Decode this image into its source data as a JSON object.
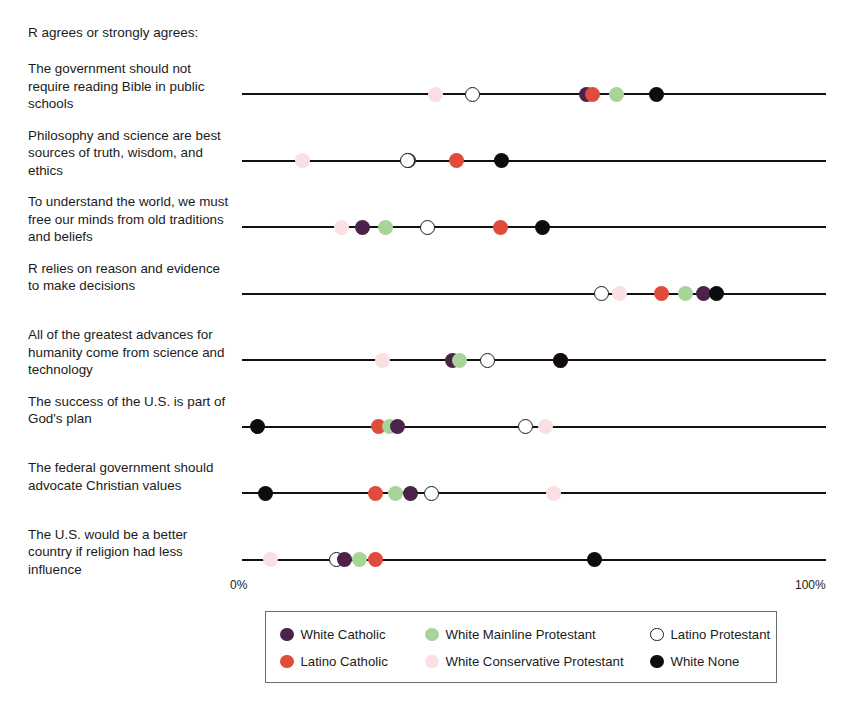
{
  "header": {
    "note": "R agrees or strongly agrees:"
  },
  "axis": {
    "min_label": "0%",
    "max_label": "100%",
    "min": 0,
    "max": 100
  },
  "legend": {
    "entries": [
      {
        "label": "White Catholic",
        "color": "#4b2348",
        "style": "filled"
      },
      {
        "label": "White Mainline Protestant",
        "color": "#a8d49a",
        "style": "filled"
      },
      {
        "label": "Latino Protestant",
        "color": "#ffffff",
        "style": "hollow"
      },
      {
        "label": "Latino Catholic",
        "color": "#e14b3c",
        "style": "filled"
      },
      {
        "label": "White Conservative Protestant",
        "color": "#fadfe3",
        "style": "filled"
      },
      {
        "label": "White None",
        "color": "#0d0d0d",
        "style": "filled"
      }
    ]
  },
  "chart_data": {
    "type": "scatter",
    "title": "R agrees or strongly agrees:",
    "xlabel": "",
    "ylabel": "",
    "xlim": [
      0,
      100
    ],
    "xticks": [
      0,
      100
    ],
    "xticklabels": [
      "0%",
      "100%"
    ],
    "grid": false,
    "legend_position": "bottom",
    "series": [
      {
        "name": "White Catholic",
        "color": "#4b2348",
        "style": "filled",
        "values": [
          59.0,
          28.5,
          20.7,
          79.0,
          36.0,
          26.7,
          28.8,
          17.6
        ]
      },
      {
        "name": "Latino Catholic",
        "color": "#e14b3c",
        "style": "filled",
        "values": [
          60.0,
          36.8,
          44.2,
          71.9,
          54.5,
          23.3,
          22.8,
          22.8
        ]
      },
      {
        "name": "White Mainline Protestant",
        "color": "#a8d49a",
        "style": "filled",
        "values": [
          64.2,
          null,
          24.5,
          75.9,
          37.3,
          25.3,
          26.2,
          20.2
        ]
      },
      {
        "name": "White Conservative Protestant",
        "color": "#fadfe3",
        "style": "filled",
        "values": [
          33.2,
          10.3,
          17.1,
          64.7,
          24.1,
          51.9,
          53.3,
          4.8
        ]
      },
      {
        "name": "Latino Protestant",
        "color": "#ffffff",
        "style": "hollow",
        "values": [
          39.4,
          28.4,
          31.7,
          61.5,
          42.1,
          48.5,
          32.5,
          16.1
        ]
      },
      {
        "name": "White None",
        "color": "#0d0d0d",
        "style": "filled",
        "values": [
          70.9,
          44.4,
          51.5,
          81.3,
          54.5,
          2.6,
          4.1,
          60.4
        ]
      }
    ],
    "categories": [
      "The government should not require reading Bible in public schools",
      "Philosophy and science are best sources of truth, wisdom, and ethics",
      "To understand the world, we must free our minds from old traditions and beliefs",
      "R relies on reason and evidence to make decisions",
      "All of the greatest advances for humanity come from science and technology",
      "The success of the U.S. is part of God's plan",
      "The federal government should advocate Christian values",
      "The U.S. would be a better country if religion had less influence"
    ]
  },
  "rows": [
    {
      "label": "The government should not require reading Bible in public schools",
      "points": [
        {
          "group": "White Conservative Protestant",
          "value": 33.2,
          "color": "#fadfe3",
          "style": "filled"
        },
        {
          "group": "Latino Protestant",
          "value": 39.4,
          "color": "#ffffff",
          "style": "hollow"
        },
        {
          "group": "White Catholic",
          "value": 59.0,
          "color": "#4b2348",
          "style": "filled"
        },
        {
          "group": "Latino Catholic",
          "value": 60.0,
          "color": "#e14b3c",
          "style": "filled"
        },
        {
          "group": "White Mainline Protestant",
          "value": 64.2,
          "color": "#a8d49a",
          "style": "filled"
        },
        {
          "group": "White None",
          "value": 70.9,
          "color": "#0d0d0d",
          "style": "filled"
        }
      ]
    },
    {
      "label": "Philosophy and science are best sources of truth, wisdom, and ethics",
      "points": [
        {
          "group": "White Conservative Protestant",
          "value": 10.3,
          "color": "#fadfe3",
          "style": "filled"
        },
        {
          "group": "White Catholic",
          "value": 28.5,
          "color": "#4b2348",
          "style": "filled"
        },
        {
          "group": "Latino Protestant",
          "value": 28.4,
          "color": "#ffffff",
          "style": "hollow"
        },
        {
          "group": "Latino Catholic",
          "value": 36.8,
          "color": "#e14b3c",
          "style": "filled"
        },
        {
          "group": "White None",
          "value": 44.4,
          "color": "#0d0d0d",
          "style": "filled"
        }
      ]
    },
    {
      "label": "To understand the world, we must free our minds from old traditions and beliefs",
      "points": [
        {
          "group": "White Conservative Protestant",
          "value": 17.1,
          "color": "#fadfe3",
          "style": "filled"
        },
        {
          "group": "White Catholic",
          "value": 20.7,
          "color": "#4b2348",
          "style": "filled"
        },
        {
          "group": "White Mainline Protestant",
          "value": 24.5,
          "color": "#a8d49a",
          "style": "filled"
        },
        {
          "group": "Latino Protestant",
          "value": 31.7,
          "color": "#ffffff",
          "style": "hollow"
        },
        {
          "group": "Latino Catholic",
          "value": 44.2,
          "color": "#e14b3c",
          "style": "filled"
        },
        {
          "group": "White None",
          "value": 51.5,
          "color": "#0d0d0d",
          "style": "filled"
        }
      ]
    },
    {
      "label": "R relies on reason and evidence to make decisions",
      "points": [
        {
          "group": "Latino Protestant",
          "value": 61.5,
          "color": "#ffffff",
          "style": "hollow"
        },
        {
          "group": "White Conservative Protestant",
          "value": 64.7,
          "color": "#fadfe3",
          "style": "filled"
        },
        {
          "group": "Latino Catholic",
          "value": 71.9,
          "color": "#e14b3c",
          "style": "filled"
        },
        {
          "group": "White Mainline Protestant",
          "value": 75.9,
          "color": "#a8d49a",
          "style": "filled"
        },
        {
          "group": "White Catholic",
          "value": 79.0,
          "color": "#4b2348",
          "style": "filled"
        },
        {
          "group": "White None",
          "value": 81.3,
          "color": "#0d0d0d",
          "style": "filled"
        }
      ]
    },
    {
      "label": "All of the greatest advances for humanity come from science and technology",
      "points": [
        {
          "group": "White Conservative Protestant",
          "value": 24.1,
          "color": "#fadfe3",
          "style": "filled"
        },
        {
          "group": "White Catholic",
          "value": 36.0,
          "color": "#4b2348",
          "style": "filled"
        },
        {
          "group": "White Mainline Protestant",
          "value": 37.3,
          "color": "#a8d49a",
          "style": "filled"
        },
        {
          "group": "Latino Protestant",
          "value": 42.1,
          "color": "#ffffff",
          "style": "hollow"
        },
        {
          "group": "Latino Catholic",
          "value": 54.5,
          "color": "#e14b3c",
          "style": "filled"
        },
        {
          "group": "White None",
          "value": 54.5,
          "color": "#0d0d0d",
          "style": "filled"
        }
      ]
    },
    {
      "label": "The success of the U.S. is part of God's plan",
      "points": [
        {
          "group": "White None",
          "value": 2.6,
          "color": "#0d0d0d",
          "style": "filled"
        },
        {
          "group": "Latino Catholic",
          "value": 23.3,
          "color": "#e14b3c",
          "style": "filled"
        },
        {
          "group": "White Mainline Protestant",
          "value": 25.3,
          "color": "#a8d49a",
          "style": "filled"
        },
        {
          "group": "White Catholic",
          "value": 26.7,
          "color": "#4b2348",
          "style": "filled"
        },
        {
          "group": "Latino Protestant",
          "value": 48.5,
          "color": "#ffffff",
          "style": "hollow"
        },
        {
          "group": "White Conservative Protestant",
          "value": 51.9,
          "color": "#fadfe3",
          "style": "filled"
        }
      ]
    },
    {
      "label": "The federal government should advocate Christian values",
      "points": [
        {
          "group": "White None",
          "value": 4.1,
          "color": "#0d0d0d",
          "style": "filled"
        },
        {
          "group": "Latino Catholic",
          "value": 22.8,
          "color": "#e14b3c",
          "style": "filled"
        },
        {
          "group": "White Mainline Protestant",
          "value": 26.2,
          "color": "#a8d49a",
          "style": "filled"
        },
        {
          "group": "White Catholic",
          "value": 28.8,
          "color": "#4b2348",
          "style": "filled"
        },
        {
          "group": "Latino Protestant",
          "value": 32.5,
          "color": "#ffffff",
          "style": "hollow"
        },
        {
          "group": "White Conservative Protestant",
          "value": 53.3,
          "color": "#fadfe3",
          "style": "filled"
        }
      ]
    },
    {
      "label": "The U.S. would be a better country if religion had less influence",
      "points": [
        {
          "group": "White Conservative Protestant",
          "value": 4.8,
          "color": "#fadfe3",
          "style": "filled"
        },
        {
          "group": "Latino Protestant",
          "value": 16.1,
          "color": "#ffffff",
          "style": "hollow"
        },
        {
          "group": "White Catholic",
          "value": 17.6,
          "color": "#4b2348",
          "style": "filled"
        },
        {
          "group": "White Mainline Protestant",
          "value": 20.2,
          "color": "#a8d49a",
          "style": "filled"
        },
        {
          "group": "Latino Catholic",
          "value": 22.8,
          "color": "#e14b3c",
          "style": "filled"
        },
        {
          "group": "White None",
          "value": 60.4,
          "color": "#0d0d0d",
          "style": "filled"
        }
      ]
    }
  ]
}
